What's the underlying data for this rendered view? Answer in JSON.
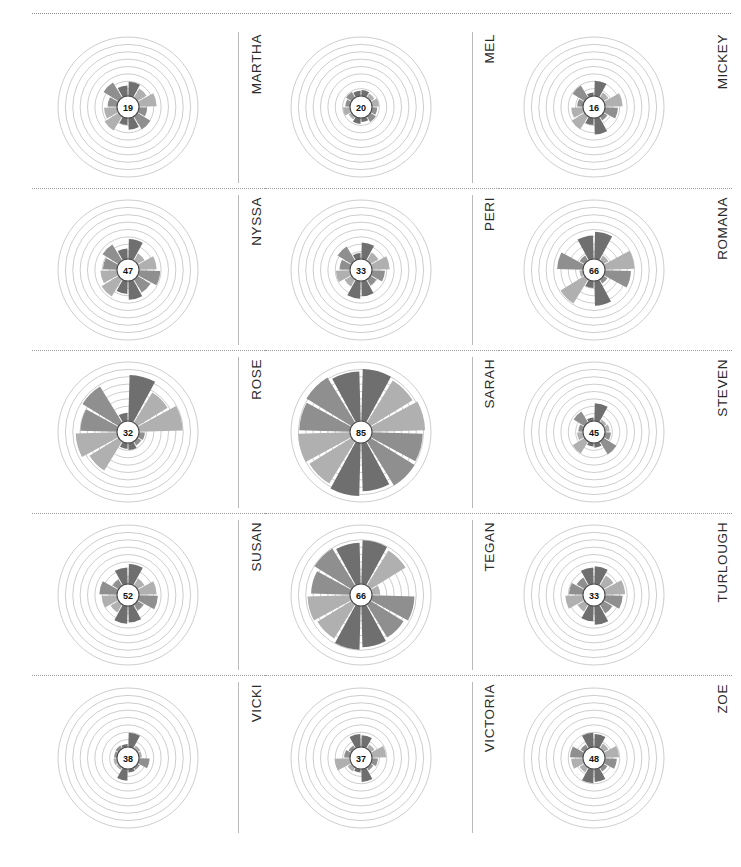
{
  "figure": {
    "title": "",
    "layout": {
      "rows": 5,
      "cols": 3
    },
    "palette": {
      "wedge_dark": "#6f6f6f",
      "wedge_mid": "#8f8f8f",
      "wedge_light": "#b0b0b0",
      "gridline": "#b7b7b7",
      "separator": "#9a9a9a",
      "hub_fill": "#ffffff",
      "hub_stroke": "#4a4a4a",
      "text": "#231f20"
    }
  },
  "chart_data": {
    "type": "pie",
    "subtype": "rose / polar-area small multiples",
    "title": "",
    "xlabel": "",
    "ylabel": "",
    "grid": true,
    "legend": "none",
    "rings": 8,
    "sectors": 12,
    "rmax": 100,
    "panels": [
      {
        "label": "MARTHA",
        "center_value": "19",
        "value": 19,
        "row": 1,
        "col": 1,
        "values": [
          24,
          18,
          30,
          14,
          26,
          20,
          12,
          28,
          22,
          16,
          30,
          18
        ]
      },
      {
        "label": "MEL",
        "center_value": "20",
        "value": 20,
        "row": 1,
        "col": 2,
        "values": [
          10,
          8,
          12,
          9,
          11,
          7,
          10,
          6,
          12,
          8,
          11,
          9
        ]
      },
      {
        "label": "MICKEY",
        "center_value": "16",
        "value": 16,
        "row": 1,
        "col": 3,
        "values": [
          26,
          10,
          30,
          22,
          8,
          28,
          12,
          26,
          20,
          10,
          24,
          6
        ]
      },
      {
        "label": "NYSSA",
        "center_value": "47",
        "value": 47,
        "row": 2,
        "col": 1,
        "values": [
          34,
          14,
          30,
          36,
          26,
          32,
          22,
          34,
          28,
          24,
          32,
          18
        ]
      },
      {
        "label": "PERI",
        "center_value": "33",
        "value": 33,
        "row": 2,
        "col": 2,
        "values": [
          28,
          16,
          30,
          22,
          12,
          26,
          30,
          14,
          24,
          18,
          28,
          10
        ]
      },
      {
        "label": "ROMANA",
        "center_value": "66",
        "value": 66,
        "row": 2,
        "col": 3,
        "values": [
          46,
          10,
          50,
          44,
          8,
          42,
          12,
          48,
          6,
          44,
          10,
          40
        ]
      },
      {
        "label": "ROSE",
        "center_value": "32",
        "value": 32,
        "row": 3,
        "col": 1,
        "values": [
          78,
          60,
          74,
          10,
          8,
          12,
          10,
          58,
          70,
          62,
          72,
          14
        ]
      },
      {
        "label": "SARAH",
        "center_value": "85",
        "value": 85,
        "row": 3,
        "col": 2,
        "values": [
          88,
          84,
          90,
          86,
          88,
          82,
          90,
          84,
          88,
          86,
          90,
          84
        ]
      },
      {
        "label": "STEVEN",
        "center_value": "45",
        "value": 45,
        "row": 3,
        "col": 3,
        "values": [
          30,
          6,
          8,
          10,
          26,
          8,
          6,
          24,
          10,
          8,
          22,
          6
        ]
      },
      {
        "label": "SUSAN",
        "center_value": "52",
        "value": 52,
        "row": 4,
        "col": 1,
        "values": [
          34,
          14,
          30,
          32,
          12,
          28,
          30,
          16,
          26,
          30,
          12,
          28
        ]
      },
      {
        "label": "TEGAN",
        "center_value": "66",
        "value": 66,
        "row": 4,
        "col": 2,
        "values": [
          74,
          70,
          14,
          72,
          66,
          70,
          74,
          68,
          72,
          66,
          74,
          70
        ]
      },
      {
        "label": "TURLOUGH",
        "center_value": "33",
        "value": 33,
        "row": 4,
        "col": 3,
        "values": [
          30,
          20,
          34,
          30,
          18,
          32,
          26,
          14,
          30,
          24,
          16,
          28
        ]
      },
      {
        "label": "VICKI",
        "center_value": "38",
        "value": 38,
        "row": 5,
        "col": 1,
        "values": [
          24,
          6,
          5,
          18,
          5,
          6,
          20,
          5,
          6,
          5,
          6,
          5
        ]
      },
      {
        "label": "VICTORIA",
        "center_value": "37",
        "value": 37,
        "row": 5,
        "col": 2,
        "values": [
          20,
          8,
          24,
          10,
          6,
          22,
          6,
          8,
          26,
          10,
          6,
          22
        ]
      },
      {
        "label": "ZOE",
        "center_value": "48",
        "value": 48,
        "row": 5,
        "col": 3,
        "values": [
          22,
          10,
          24,
          20,
          8,
          22,
          24,
          10,
          20,
          22,
          8,
          24
        ]
      }
    ]
  }
}
